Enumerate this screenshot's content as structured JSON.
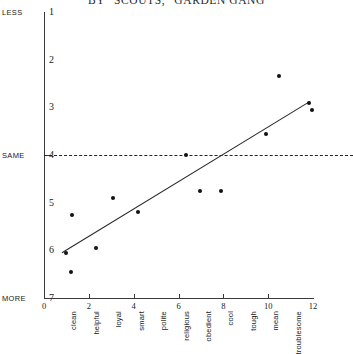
{
  "chart_data": {
    "type": "scatter",
    "title": "BY “SCOUTS,” GARDEN GANG",
    "xlabel": "",
    "ylabel": "",
    "xlim": [
      0,
      12
    ],
    "ylim": [
      1,
      7
    ],
    "y_inverted": true,
    "grid": false,
    "legend": "none",
    "x_ticks": [
      "0",
      "2",
      "4",
      "6",
      "8",
      "10",
      "12"
    ],
    "x_tick_values": [
      0,
      2,
      4,
      6,
      8,
      10,
      12
    ],
    "y_ticks": [
      "1",
      "2",
      "3",
      "4",
      "5",
      "6",
      "7"
    ],
    "y_tick_values": [
      1,
      2,
      3,
      4,
      5,
      6,
      7
    ],
    "y_anchor_labels": [
      {
        "label": "LESS",
        "value": 1
      },
      {
        "label": "SAME",
        "value": 4
      },
      {
        "label": "MORE",
        "value": 7
      }
    ],
    "categories": [
      "clean",
      "helpful",
      "loyal",
      "smart",
      "polite",
      "religious",
      "obedient",
      "cool",
      "tough",
      "mean",
      "troublesome"
    ],
    "x": [
      1,
      1.2,
      2.1,
      3.1,
      4.1,
      5.1,
      6.1,
      7.1,
      8.1,
      9.1,
      10.1,
      11,
      11.2
    ],
    "points": [
      {
        "label": "clean",
        "x": 1.0,
        "y": 6.05
      },
      {
        "label": "helpful",
        "x": 1.2,
        "y": 6.45
      },
      {
        "label": "helpful",
        "x": 1.25,
        "y": 5.25
      },
      {
        "label": "loyal",
        "x": 2.3,
        "y": 5.95
      },
      {
        "label": "smart",
        "x": 3.1,
        "y": 4.9
      },
      {
        "label": "polite",
        "x": 4.2,
        "y": 5.2
      },
      {
        "label": "religious",
        "x": 6.35,
        "y": 4.0
      },
      {
        "label": "obedient",
        "x": 6.95,
        "y": 4.75
      },
      {
        "label": "cool",
        "x": 7.9,
        "y": 4.75
      },
      {
        "label": "tough",
        "x": 9.9,
        "y": 3.55
      },
      {
        "label": "mean",
        "x": 10.5,
        "y": 2.35
      },
      {
        "label": "troublesome",
        "x": 11.8,
        "y": 2.9
      },
      {
        "label": "troublesome",
        "x": 11.95,
        "y": 3.05
      }
    ],
    "reference_line": {
      "axis": "y",
      "value": 4,
      "style": "dashed",
      "label": "SAME"
    },
    "trend_line": {
      "x0": 0.8,
      "y0": 6.05,
      "x1": 11.85,
      "y1": 2.88,
      "style": "solid"
    }
  },
  "colors": {
    "ink": "#1a1a1a",
    "axis": "#3a3a3a",
    "point": "#111111",
    "trend": "#2b2b2b",
    "background": "#ffffff"
  }
}
